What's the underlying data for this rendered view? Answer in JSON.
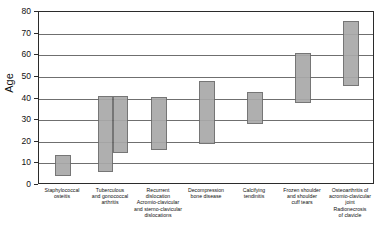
{
  "chart_data": {
    "type": "bar",
    "subtype": "floating-range-bar",
    "title": "",
    "xlabel": "",
    "ylabel": "Age",
    "ylim": [
      0,
      80
    ],
    "yticks": [
      0,
      10,
      20,
      30,
      40,
      50,
      60,
      70,
      80
    ],
    "ytick_labels": [
      "0",
      "10",
      "20",
      "30",
      "40",
      "50",
      "60",
      "70",
      "80"
    ],
    "grid": true,
    "legend": "none",
    "categories": [
      "Staphylococcal\nosteitis",
      "Tuberculous\nand gonococcal\narthritis",
      "Recurrent dislocation\nAcromio-clavicular\nand sterno-clavicular\ndislocations",
      "Decompression\nbone disease",
      "Calcifying\ntendinitis",
      "Frozen shoulder\nand shoulder\ncuff tears",
      "Osteoarthritis of\nacromio-clavicular\njoint\nRadionecrosis\nof clavicle"
    ],
    "bars": [
      {
        "category": "Staphylococcal osteitis",
        "low": 4,
        "high": 14
      },
      {
        "category": "Tuberculous and gonococcal arthritis",
        "low": 6,
        "high": 41
      },
      {
        "category": "Tuberculous and gonococcal arthritis",
        "low": 15,
        "high": 41
      },
      {
        "category": "Recurrent dislocation Acromio-clavicular and sterno-clavicular dislocations",
        "low": 16,
        "high": 40.5
      },
      {
        "category": "Decompression bone disease",
        "low": 19,
        "high": 48
      },
      {
        "category": "Calcifying tendinitis",
        "low": 28,
        "high": 43
      },
      {
        "category": "Frozen shoulder and shoulder cuff tears",
        "low": 38,
        "high": 61
      },
      {
        "category": "Osteoarthritis of acromio-clavicular joint Radionecrosis of clavicle",
        "low": 46,
        "high": 76
      }
    ],
    "colors": {
      "bar_fill": "#a9a9a9",
      "bar_border": "#6b6b6b",
      "gridline": "#6f6f6f",
      "axis": "#2b2b2b",
      "text": "#111111",
      "background": "#ffffff"
    }
  }
}
